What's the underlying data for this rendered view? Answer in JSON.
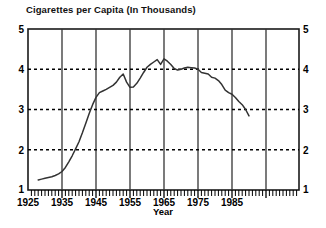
{
  "chart_data": {
    "type": "line",
    "title": "Cigarettes per Capita (In Thousands)",
    "xlabel": "Year",
    "ylabel": "",
    "xlim": [
      1925,
      1905
    ],
    "x_range": [
      1925,
      1905
    ],
    "x_axis": {
      "min": 1925,
      "max": 1905,
      "start": 1925,
      "end": 1905
    },
    "ylim": [
      1,
      5
    ],
    "xticks": [
      1925,
      1935,
      1945,
      1955,
      1965,
      1975,
      1985
    ],
    "xtick_labels": [
      "1925",
      "1935",
      "1945",
      "1955",
      "1965",
      "1975",
      "1985"
    ],
    "yticks": [
      1,
      2,
      3,
      4,
      5
    ],
    "ytick_labels": [
      "1",
      "2",
      "3",
      "4",
      "5"
    ],
    "ytick_labels_right": [
      "1",
      "2",
      "3",
      "4",
      "5"
    ],
    "grid": {
      "horizontal": "dotted at y = 2, 3, 4",
      "vertical": "solid at x = 1935, 1945, 1955, 1965, 1975, 1985",
      "minor_x_ticks": "every year along the bottom axis"
    },
    "legend": null,
    "legend_position": "none",
    "series": [
      {
        "name": "Cigarettes per Capita",
        "color": "#333333",
        "x": [
          1928,
          1929,
          1930,
          1931,
          1932,
          1933,
          1934,
          1935,
          1936,
          1937,
          1938,
          1939,
          1940,
          1941,
          1942,
          1943,
          1944,
          1945,
          1946,
          1947,
          1948,
          1949,
          1950,
          1951,
          1952,
          1953,
          1954,
          1955,
          1956,
          1957,
          1958,
          1959,
          1960,
          1961,
          1962,
          1963,
          1964,
          1965,
          1966,
          1967,
          1968,
          1969,
          1970,
          1971,
          1972,
          1973,
          1974,
          1975,
          1976,
          1977,
          1978,
          1979,
          1980,
          1981,
          1982,
          1983,
          1984,
          1985,
          1986,
          1987,
          1988,
          1989,
          1990
        ],
        "values": [
          1.25,
          1.27,
          1.29,
          1.31,
          1.33,
          1.36,
          1.4,
          1.46,
          1.56,
          1.7,
          1.85,
          2.02,
          2.2,
          2.42,
          2.66,
          2.9,
          3.12,
          3.3,
          3.42,
          3.46,
          3.5,
          3.55,
          3.6,
          3.68,
          3.8,
          3.88,
          3.68,
          3.55,
          3.56,
          3.65,
          3.78,
          3.92,
          4.05,
          4.12,
          4.18,
          4.24,
          4.12,
          4.26,
          4.2,
          4.12,
          4.02,
          3.98,
          4.0,
          4.03,
          4.05,
          4.04,
          4.03,
          4.0,
          3.92,
          3.9,
          3.88,
          3.8,
          3.78,
          3.72,
          3.62,
          3.48,
          3.42,
          3.38,
          3.3,
          3.2,
          3.12,
          3.0,
          2.84
        ]
      }
    ],
    "notes": [
      "Steady rise from about 1.25 in the late 1920s to a plateau near 3.5 in the late 1940s",
      "Local peak near 3.9 around 1953 followed by a dip to about 3.55 in 1955",
      "Overall maximum about 4.26 around 1965",
      "Long decline after the mid-1970s to about 2.85 at the right edge"
    ]
  },
  "figure": {
    "title": "Cigarettes per Capita (In Thousands)",
    "x_axis_title": "Year"
  },
  "colors": {
    "axis": "#1a1a1a",
    "grid_solid": "#333333",
    "grid_dotted": "#000000",
    "line": "#333333",
    "background": "#ffffff",
    "text": "#000000"
  }
}
